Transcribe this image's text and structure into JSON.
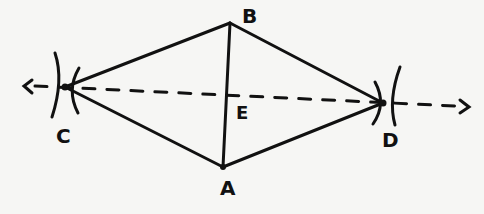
{
  "diagram": {
    "type": "geometric-construction",
    "stroke_color": "#111111",
    "background_color": "#f6f6f4",
    "points": {
      "A": {
        "label": "A",
        "x": 223,
        "y": 167
      },
      "B": {
        "label": "B",
        "x": 230,
        "y": 23
      },
      "C": {
        "label": "C",
        "x": 65,
        "y": 87
      },
      "D": {
        "label": "D",
        "x": 383,
        "y": 103
      },
      "E": {
        "label": "E",
        "x": 227,
        "y": 95
      }
    },
    "segments": [
      {
        "from": "C",
        "to": "B",
        "style": "solid"
      },
      {
        "from": "B",
        "to": "D",
        "style": "solid"
      },
      {
        "from": "D",
        "to": "A",
        "style": "solid"
      },
      {
        "from": "A",
        "to": "C",
        "style": "solid"
      },
      {
        "from": "A",
        "to": "B",
        "style": "solid"
      }
    ],
    "dashed_line": {
      "through": [
        "C",
        "D"
      ],
      "arrows": "both",
      "style": "dashed"
    },
    "arc_marks": [
      "C",
      "D"
    ]
  }
}
